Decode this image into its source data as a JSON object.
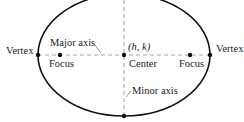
{
  "diagram": {
    "type": "ellipse",
    "labels": {
      "vertex_left": "Vertex",
      "vertex_right": "Vertex",
      "major_axis": "Major axis",
      "minor_axis": "Minor axis",
      "focus_left": "Focus",
      "focus_right": "Focus",
      "center": "Center",
      "center_coords": "(h, k)"
    },
    "colors": {
      "curve": "#111111",
      "axis": "#999999",
      "text": "#222222"
    }
  }
}
